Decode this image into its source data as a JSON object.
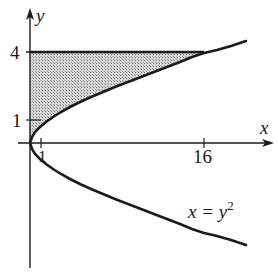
{
  "diagram": {
    "type": "region-between-curves",
    "axes": {
      "x_label": "x",
      "y_label": "y",
      "x_ticks": [
        {
          "value": 1,
          "label": "1"
        },
        {
          "value": 16,
          "label": "16"
        }
      ],
      "y_ticks": [
        {
          "value": 1,
          "label": "1"
        },
        {
          "value": 4,
          "label": "4"
        }
      ]
    },
    "curve": {
      "equation_lhs": "x = y",
      "equation_exp": "2",
      "description": "parabola opening right with vertex at origin"
    },
    "horizontal_line": {
      "y": 4
    },
    "shaded_region": "bounded by y-axis, y = 4, and x = y^2 for 0 ≤ y ≤ 4",
    "colors": {
      "stroke": "#1a1a1a",
      "fill": "#bdbdbd"
    }
  }
}
